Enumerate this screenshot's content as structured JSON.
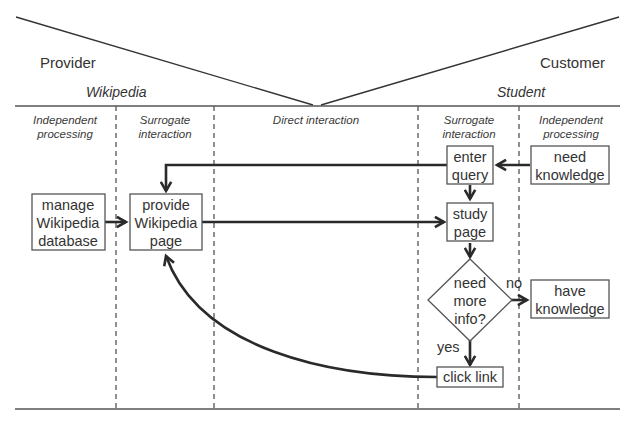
{
  "header": {
    "provider_label": "Provider",
    "customer_label": "Customer",
    "provider_name": "Wikipedia",
    "customer_name": "Student"
  },
  "lanes": [
    {
      "line1": "Independent",
      "line2": "processing"
    },
    {
      "line1": "Surrogate",
      "line2": "interaction"
    },
    {
      "line1": "Direct interaction",
      "line2": ""
    },
    {
      "line1": "Surrogate",
      "line2": "interaction"
    },
    {
      "line1": "Independent",
      "line2": "processing"
    }
  ],
  "nodes": {
    "manage_db": {
      "lines": [
        "manage",
        "Wikipedia",
        "database"
      ]
    },
    "provide_page": {
      "lines": [
        "provide",
        "Wikipedia",
        "page"
      ]
    },
    "enter_query": {
      "lines": [
        "enter",
        "query"
      ]
    },
    "need_knowledge": {
      "lines": [
        "need",
        "knowledge"
      ]
    },
    "study_page": {
      "lines": [
        "study",
        "page"
      ]
    },
    "decision": {
      "lines": [
        "need",
        "more",
        "info?"
      ]
    },
    "have_knowledge": {
      "lines": [
        "have",
        "knowledge"
      ]
    },
    "click_link": {
      "lines": [
        "click link"
      ]
    }
  },
  "edge_labels": {
    "no": "no",
    "yes": "yes"
  },
  "colors": {
    "line": "#555555",
    "flow": "#2a2a2a",
    "text": "#333333"
  }
}
